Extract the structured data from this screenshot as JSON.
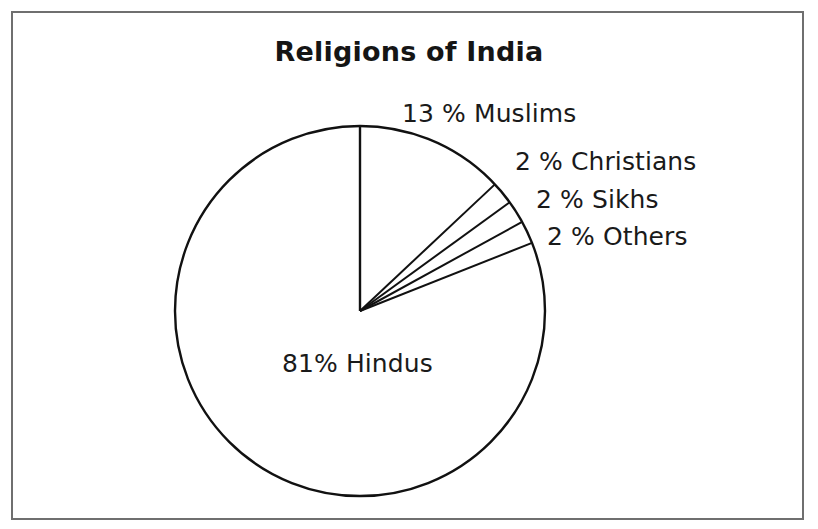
{
  "figure": {
    "title": "Religions of India",
    "background_color": "#ffffff",
    "frame_color": "#6f6f6f",
    "stroke_color": "#111111"
  },
  "labels": {
    "muslims": "13 % Muslims",
    "christians": "2 % Christians",
    "sikhs": "2 % Sikhs",
    "others": "2 % Others",
    "hindus": "81% Hindus"
  },
  "chart_data": {
    "type": "pie",
    "title": "Religions of India",
    "xlabel": "",
    "ylabel": "",
    "unit": "percent",
    "total": 100,
    "start_angle_deg": 90,
    "direction": "clockwise",
    "legend": "none",
    "grid": false,
    "categories": [
      "Muslims",
      "Christians",
      "Sikhs",
      "Others",
      "Hindus"
    ],
    "values": [
      13,
      2,
      2,
      2,
      81
    ],
    "slices": [
      {
        "label": "Muslims",
        "value": 13,
        "data_label": "13 % Muslims",
        "start_deg": 0.0,
        "end_deg": 46.8,
        "fill": "none",
        "stroke": "#111111"
      },
      {
        "label": "Christians",
        "value": 2,
        "data_label": "2 % Christians",
        "start_deg": 46.8,
        "end_deg": 54.0,
        "fill": "none",
        "stroke": "#111111"
      },
      {
        "label": "Sikhs",
        "value": 2,
        "data_label": "2 % Sikhs",
        "start_deg": 54.0,
        "end_deg": 61.2,
        "fill": "none",
        "stroke": "#111111"
      },
      {
        "label": "Others",
        "value": 2,
        "data_label": "2 % Others",
        "start_deg": 61.2,
        "end_deg": 68.4,
        "fill": "none",
        "stroke": "#111111"
      },
      {
        "label": "Hindus",
        "value": 81,
        "data_label": "81% Hindus",
        "start_deg": 68.4,
        "end_deg": 360.0,
        "fill": "none",
        "stroke": "#111111"
      }
    ],
    "geometry": {
      "center_x": 360,
      "center_y": 311,
      "radius": 185
    }
  }
}
